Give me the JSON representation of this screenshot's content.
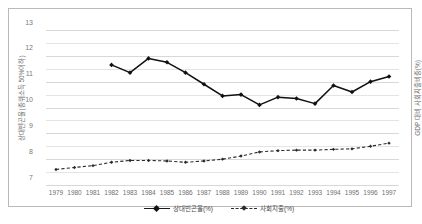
{
  "chart_data": {
    "type": "line",
    "title": "",
    "xlabel": "",
    "ylabel": "상대빈곤율(중위소득 50%이하)",
    "ylabel_right": "GDP 대비 사회지출비중(%)",
    "ylim": [
      7,
      13
    ],
    "ytick_labels": [
      "13",
      "12",
      "11",
      "10",
      "9",
      "8",
      "7"
    ],
    "ytick_values": [
      13,
      12,
      11,
      10,
      9,
      8,
      7
    ],
    "gridlines": true,
    "grid_step": 0.5,
    "legend_position": "bottom-center",
    "x": [
      1979,
      1980,
      1981,
      1982,
      1983,
      1984,
      1985,
      1986,
      1987,
      1988,
      1989,
      1990,
      1991,
      1992,
      1993,
      1994,
      1995,
      1996,
      1997
    ],
    "categories": [
      "1979",
      "1980",
      "1981",
      "1982",
      "1983",
      "1984",
      "1985",
      "1986",
      "1987",
      "1988",
      "1989",
      "1990",
      "1991",
      "1992",
      "1993",
      "1994",
      "1995",
      "1996",
      "1997"
    ],
    "series": [
      {
        "name": "상대빈곤율(%)",
        "style": "solid",
        "marker": "diamond",
        "color": "#111111",
        "values": [
          null,
          null,
          null,
          11.65,
          11.35,
          11.9,
          11.75,
          11.35,
          10.9,
          10.45,
          10.5,
          10.1,
          10.4,
          10.35,
          10.15,
          10.85,
          10.6,
          11.0,
          11.2
        ]
      },
      {
        "name": "사회지출(%)",
        "style": "dashed",
        "marker": "diamond-small",
        "color": "#2b2b2b",
        "values": [
          7.6,
          7.68,
          7.75,
          7.88,
          7.95,
          7.95,
          7.93,
          7.88,
          7.93,
          8.0,
          8.12,
          8.28,
          8.33,
          8.35,
          8.35,
          8.38,
          8.4,
          8.5,
          8.62
        ]
      }
    ]
  },
  "legend": {
    "entries": [
      {
        "label": "상대빈곤율(%)"
      },
      {
        "label": "사회지출(%)"
      }
    ]
  }
}
